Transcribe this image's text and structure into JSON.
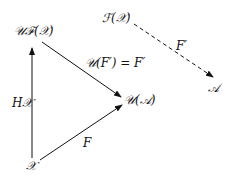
{
  "diagram": {
    "type": "commutative-diagram",
    "nodes": {
      "UFX": "𝒰ℱ(𝒳)",
      "FX": "ℱ(𝒳)",
      "UA": "𝒰(𝒜)",
      "A": "𝒜",
      "X": "𝒳"
    },
    "arrows": {
      "H": "H𝒳",
      "F": "F",
      "UF": "𝒰(F′) = F′",
      "Fprime": "F′"
    },
    "edges": [
      {
        "from": "X",
        "to": "UFX",
        "label": "H𝒳",
        "style": "solid"
      },
      {
        "from": "X",
        "to": "UA",
        "label": "F",
        "style": "solid"
      },
      {
        "from": "UFX",
        "to": "UA",
        "label": "𝒰(F′) = F′",
        "style": "solid"
      },
      {
        "from": "FX",
        "to": "A",
        "label": "F′",
        "style": "dashed"
      }
    ]
  }
}
